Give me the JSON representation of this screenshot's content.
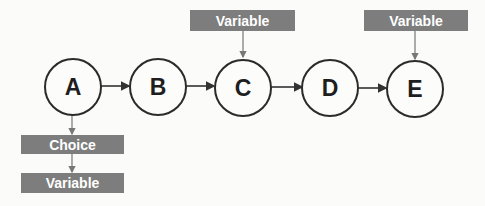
{
  "diagram": {
    "nodes": [
      {
        "id": "A",
        "label": "A"
      },
      {
        "id": "B",
        "label": "B"
      },
      {
        "id": "C",
        "label": "C"
      },
      {
        "id": "D",
        "label": "D"
      },
      {
        "id": "E",
        "label": "E"
      }
    ],
    "edges": [
      {
        "from": "A",
        "to": "B"
      },
      {
        "from": "B",
        "to": "C"
      },
      {
        "from": "C",
        "to": "D"
      },
      {
        "from": "D",
        "to": "E"
      },
      {
        "from": "variable_c",
        "to": "C"
      },
      {
        "from": "variable_e",
        "to": "E"
      },
      {
        "from": "A",
        "to": "choice"
      },
      {
        "from": "choice",
        "to": "variable_a"
      }
    ],
    "labels": {
      "variable_c": "Variable",
      "variable_e": "Variable",
      "choice": "Choice",
      "variable_a": "Variable"
    },
    "colors": {
      "box_fill": "#7d7d7d",
      "box_text": "#ffffff",
      "stroke": "#2b2b2b"
    }
  }
}
